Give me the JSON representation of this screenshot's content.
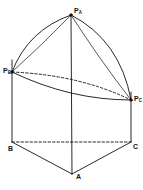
{
  "diagram": {
    "colors": {
      "stroke": "#111111",
      "background": "#ffffff"
    },
    "points": {
      "PA": {
        "label": "P",
        "sub": "A",
        "x": 71,
        "y": 15
      },
      "PB": {
        "label": "P",
        "sub": "B",
        "x": 12,
        "y": 72
      },
      "PC": {
        "label": "P",
        "sub": "C",
        "x": 131,
        "y": 100
      },
      "A": {
        "label": "A",
        "x": 72,
        "y": 174
      },
      "B": {
        "label": "B",
        "x": 12,
        "y": 142
      },
      "C": {
        "label": "C",
        "x": 131,
        "y": 142
      }
    }
  }
}
